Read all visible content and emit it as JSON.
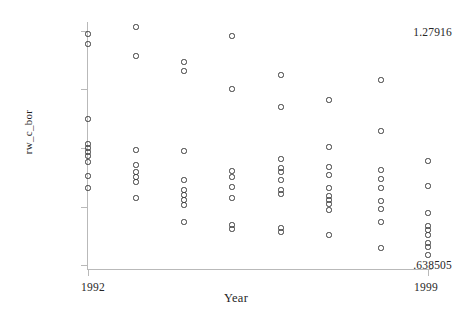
{
  "chart_data": {
    "type": "scatter",
    "title": "",
    "xlabel": "Year",
    "ylabel": "rw_c_bor",
    "xlim": [
      1992,
      1999
    ],
    "ylim": [
      0.638505,
      1.27916
    ],
    "xticks": [
      "1992",
      "1999"
    ],
    "yticks": [
      "1.27916",
      ".638505"
    ],
    "grid": false,
    "legend": null,
    "marker": "open-circle",
    "marker_color": "#3a3a3a",
    "axis_color": "#b9b9b9",
    "x": [
      1992,
      1992,
      1992,
      1992,
      1992,
      1992,
      1992,
      1992,
      1992,
      1992,
      1993,
      1993,
      1993,
      1993,
      1993,
      1993,
      1993,
      1993,
      1994,
      1994,
      1994,
      1994,
      1994,
      1994,
      1994,
      1994,
      1994,
      1995,
      1995,
      1995,
      1995,
      1995,
      1995,
      1995,
      1995,
      1996,
      1996,
      1996,
      1996,
      1996,
      1996,
      1996,
      1996,
      1996,
      1996,
      1997,
      1997,
      1997,
      1997,
      1997,
      1997,
      1997,
      1997,
      1997,
      1997,
      1998,
      1998,
      1998,
      1998,
      1998,
      1998,
      1998,
      1998,
      1998,
      1999,
      1999,
      1999,
      1999,
      1999,
      1999,
      1999,
      1999,
      1999
    ],
    "y": [
      1.2734,
      1.2458,
      1.0388,
      0.995,
      0.9895,
      0.984,
      0.9758,
      0.9566,
      0.9319,
      0.9155,
      1.2792,
      1.142,
      0.9895,
      0.9593,
      0.9456,
      0.9401,
      0.9346,
      0.8771,
      1.1667,
      1.153,
      0.9813,
      0.9017,
      0.8853,
      0.8798,
      0.8743,
      0.8688,
      0.8332,
      1.2677,
      1.1064,
      0.9401,
      0.9319,
      0.9072,
      0.8853,
      0.8524,
      0.7948,
      1.1311,
      1.058,
      0.9593,
      0.9511,
      0.9429,
      0.9209,
      0.9127,
      0.9072,
      0.8524,
      0.8469,
      1.058,
      0.9895,
      0.9429,
      0.9346,
      0.9072,
      0.899,
      0.8908,
      0.8853,
      0.8634,
      0.8085,
      1.1229,
      0.9703,
      0.9401,
      0.9319,
      0.9017,
      0.8908,
      0.8826,
      0.8524,
      0.7838,
      0.9703,
      0.9237,
      0.8908,
      0.8716,
      0.8661,
      0.8606,
      0.8332,
      0.8222,
      0.8085
    ],
    "points": [
      {
        "x": 1992,
        "y": 1.2734,
        "px": 88,
        "py": 34
      },
      {
        "x": 1992,
        "y": 1.2458,
        "px": 88,
        "py": 44
      },
      {
        "x": 1992,
        "y": 1.0388,
        "px": 88,
        "py": 119
      },
      {
        "x": 1992,
        "y": 0.995,
        "px": 88,
        "py": 144
      },
      {
        "x": 1992,
        "y": 0.9895,
        "px": 88,
        "py": 148
      },
      {
        "x": 1992,
        "y": 0.984,
        "px": 88,
        "py": 152
      },
      {
        "x": 1992,
        "y": 0.9758,
        "px": 88,
        "py": 156
      },
      {
        "x": 1992,
        "y": 0.9566,
        "px": 88,
        "py": 162
      },
      {
        "x": 1992,
        "y": 0.9319,
        "px": 88,
        "py": 176
      },
      {
        "x": 1992,
        "y": 0.9155,
        "px": 88,
        "py": 188
      },
      {
        "x": 1993,
        "y": 1.2792,
        "px": 136,
        "py": 27
      },
      {
        "x": 1993,
        "y": 1.142,
        "px": 136,
        "py": 56
      },
      {
        "x": 1993,
        "y": 0.9895,
        "px": 136,
        "py": 150
      },
      {
        "x": 1993,
        "y": 0.9593,
        "px": 136,
        "py": 165
      },
      {
        "x": 1993,
        "y": 0.9456,
        "px": 136,
        "py": 172
      },
      {
        "x": 1993,
        "y": 0.9401,
        "px": 136,
        "py": 177
      },
      {
        "x": 1993,
        "y": 0.9346,
        "px": 136,
        "py": 182
      },
      {
        "x": 1993,
        "y": 0.8771,
        "px": 136,
        "py": 198
      },
      {
        "x": 1994,
        "y": 1.1667,
        "px": 184,
        "py": 62
      },
      {
        "x": 1994,
        "y": 1.153,
        "px": 184,
        "py": 71
      },
      {
        "x": 1994,
        "y": 0.9813,
        "px": 184,
        "py": 151
      },
      {
        "x": 1994,
        "y": 0.9017,
        "px": 184,
        "py": 180
      },
      {
        "x": 1994,
        "y": 0.8853,
        "px": 184,
        "py": 190
      },
      {
        "x": 1994,
        "y": 0.8798,
        "px": 184,
        "py": 195
      },
      {
        "x": 1994,
        "y": 0.8743,
        "px": 184,
        "py": 200
      },
      {
        "x": 1994,
        "y": 0.8688,
        "px": 184,
        "py": 205
      },
      {
        "x": 1994,
        "y": 0.8332,
        "px": 184,
        "py": 222
      },
      {
        "x": 1995,
        "y": 1.2677,
        "px": 232,
        "py": 36
      },
      {
        "x": 1995,
        "y": 1.1064,
        "px": 232,
        "py": 89
      },
      {
        "x": 1995,
        "y": 0.9401,
        "px": 232,
        "py": 171
      },
      {
        "x": 1995,
        "y": 0.9319,
        "px": 232,
        "py": 177
      },
      {
        "x": 1995,
        "y": 0.9072,
        "px": 232,
        "py": 187
      },
      {
        "x": 1995,
        "y": 0.8853,
        "px": 232,
        "py": 198
      },
      {
        "x": 1995,
        "y": 0.8524,
        "px": 232,
        "py": 225
      },
      {
        "x": 1995,
        "y": 0.7948,
        "px": 232,
        "py": 229
      },
      {
        "x": 1996,
        "y": 1.1311,
        "px": 281,
        "py": 75
      },
      {
        "x": 1996,
        "y": 1.058,
        "px": 281,
        "py": 107
      },
      {
        "x": 1996,
        "y": 0.9593,
        "px": 281,
        "py": 159
      },
      {
        "x": 1996,
        "y": 0.9511,
        "px": 281,
        "py": 168
      },
      {
        "x": 1996,
        "y": 0.9429,
        "px": 281,
        "py": 172
      },
      {
        "x": 1996,
        "y": 0.9209,
        "px": 281,
        "py": 180
      },
      {
        "x": 1996,
        "y": 0.9127,
        "px": 281,
        "py": 190
      },
      {
        "x": 1996,
        "y": 0.9072,
        "px": 281,
        "py": 194
      },
      {
        "x": 1996,
        "y": 0.8524,
        "px": 281,
        "py": 228
      },
      {
        "x": 1996,
        "y": 0.8469,
        "px": 281,
        "py": 232
      },
      {
        "x": 1997,
        "y": 1.058,
        "px": 329,
        "py": 100
      },
      {
        "x": 1997,
        "y": 0.9895,
        "px": 329,
        "py": 147
      },
      {
        "x": 1997,
        "y": 0.9429,
        "px": 329,
        "py": 167
      },
      {
        "x": 1997,
        "y": 0.9346,
        "px": 329,
        "py": 175
      },
      {
        "x": 1997,
        "y": 0.9072,
        "px": 329,
        "py": 188
      },
      {
        "x": 1997,
        "y": 0.899,
        "px": 329,
        "py": 196
      },
      {
        "x": 1997,
        "y": 0.8908,
        "px": 329,
        "py": 200
      },
      {
        "x": 1997,
        "y": 0.8853,
        "px": 329,
        "py": 204
      },
      {
        "x": 1997,
        "y": 0.8634,
        "px": 329,
        "py": 210
      },
      {
        "x": 1997,
        "y": 0.8085,
        "px": 329,
        "py": 235
      },
      {
        "x": 1998,
        "y": 1.1229,
        "px": 381,
        "py": 80
      },
      {
        "x": 1998,
        "y": 0.9703,
        "px": 381,
        "py": 131
      },
      {
        "x": 1998,
        "y": 0.9401,
        "px": 381,
        "py": 170
      },
      {
        "x": 1998,
        "y": 0.9319,
        "px": 381,
        "py": 179
      },
      {
        "x": 1998,
        "y": 0.9017,
        "px": 381,
        "py": 188
      },
      {
        "x": 1998,
        "y": 0.8908,
        "px": 381,
        "py": 201
      },
      {
        "x": 1998,
        "y": 0.8826,
        "px": 381,
        "py": 209
      },
      {
        "x": 1998,
        "y": 0.8524,
        "px": 381,
        "py": 222
      },
      {
        "x": 1998,
        "y": 0.7838,
        "px": 381,
        "py": 248
      },
      {
        "x": 1999,
        "y": 0.9703,
        "px": 428,
        "py": 161
      },
      {
        "x": 1999,
        "y": 0.9237,
        "px": 428,
        "py": 186
      },
      {
        "x": 1999,
        "y": 0.8908,
        "px": 428,
        "py": 213
      },
      {
        "x": 1999,
        "y": 0.8716,
        "px": 428,
        "py": 226
      },
      {
        "x": 1999,
        "y": 0.8661,
        "px": 428,
        "py": 230
      },
      {
        "x": 1999,
        "y": 0.8606,
        "px": 428,
        "py": 235
      },
      {
        "x": 1999,
        "y": 0.8332,
        "px": 428,
        "py": 243
      },
      {
        "x": 1999,
        "y": 0.8222,
        "px": 428,
        "py": 247
      },
      {
        "x": 1999,
        "y": 0.8085,
        "px": 428,
        "py": 255
      }
    ]
  },
  "axes": {
    "y_top_label": "1.27916",
    "y_bottom_label": ".638505",
    "x_left_label": "1992",
    "x_right_label": "1999",
    "y_title": "rw_c_bor",
    "x_title": "Year"
  }
}
